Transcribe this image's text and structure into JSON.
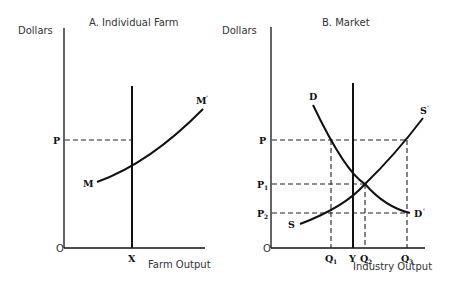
{
  "panel_a": {
    "title": "A. Individual Farm",
    "y_axis_label": "Dollars",
    "x_axis_label": "Farm Output",
    "origin_label": "O",
    "price_label": "P",
    "quantity_label": "X",
    "curve_start_label": "M",
    "curve_end_label": "M",
    "curve_end_prime": "'"
  },
  "panel_b": {
    "title": "B. Market",
    "y_axis_label": "Dollars",
    "x_axis_label": "Industry Output",
    "origin_label": "O",
    "price_labels": {
      "p": "P",
      "p1": "P",
      "p1_sub": "1",
      "p2": "P",
      "p2_sub": "2"
    },
    "quantity_labels": {
      "q1": "Q",
      "q1_sub": "1",
      "y": "Y",
      "q2": "Q",
      "q2_sub": "2",
      "q3": "Q",
      "q3_sub": "3"
    },
    "demand_start_label": "D",
    "demand_end_label": "D",
    "demand_end_prime": "'",
    "supply_start_label": "S",
    "supply_end_label": "S",
    "supply_end_prime": "'"
  }
}
